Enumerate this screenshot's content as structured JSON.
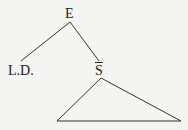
{
  "diagram": {
    "type": "syntax-tree",
    "nodes": {
      "root": {
        "label": "E"
      },
      "left": {
        "label": "L.D."
      },
      "right": {
        "label": "S"
      }
    },
    "edges": [
      {
        "from": "E",
        "to": "L.D."
      },
      {
        "from": "E",
        "to": "S"
      }
    ],
    "subtree": {
      "under": "S",
      "shape": "triangle"
    },
    "colors": {
      "line": "#333333",
      "background": "#f4f4f2"
    }
  }
}
